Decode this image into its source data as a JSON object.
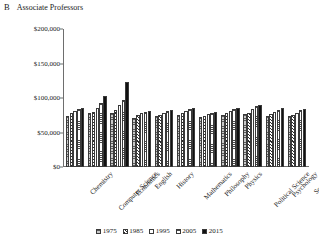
{
  "figure": {
    "panel_letter": "B",
    "title": "Associate Professors"
  },
  "chart_data": {
    "type": "bar",
    "title": "Associate Professors",
    "xlabel": "",
    "ylabel": "",
    "ylim": [
      0,
      200000
    ],
    "ytick_labels": [
      "$200,000",
      "$150,000",
      "$100,000",
      "$50,000",
      "$0"
    ],
    "ytick_values": [
      200000,
      150000,
      100000,
      50000,
      0
    ],
    "grid": false,
    "legend_position": "bottom",
    "categories": [
      "Chemistry",
      "Computer Science",
      "Economics",
      "English",
      "History",
      "Mathematics",
      "Philosophy",
      "Physics",
      "Political Science",
      "Psychology",
      "Sociology"
    ],
    "series": [
      {
        "name": "1975",
        "pattern": "gray-horizontal-lines",
        "values": [
          74000,
          79000,
          79000,
          71000,
          74000,
          76000,
          72000,
          75000,
          77000,
          74000,
          74000
        ]
      },
      {
        "name": "1985",
        "pattern": "diagonal-hatch",
        "values": [
          78000,
          80000,
          82000,
          76000,
          76000,
          78000,
          74000,
          78000,
          79000,
          77000,
          76000
        ]
      },
      {
        "name": "1995",
        "pattern": "white-solid",
        "values": [
          81000,
          85000,
          90000,
          79000,
          79000,
          81000,
          77000,
          81000,
          84000,
          80000,
          79000
        ]
      },
      {
        "name": "2005",
        "pattern": "light-horizontal-lines",
        "values": [
          84000,
          93000,
          97000,
          80000,
          81000,
          84000,
          79000,
          84000,
          88000,
          83000,
          82000
        ]
      },
      {
        "name": "2015",
        "pattern": "solid-black",
        "values": [
          85000,
          103000,
          123000,
          81000,
          82000,
          86000,
          80000,
          86000,
          90000,
          85000,
          84000
        ]
      }
    ]
  }
}
